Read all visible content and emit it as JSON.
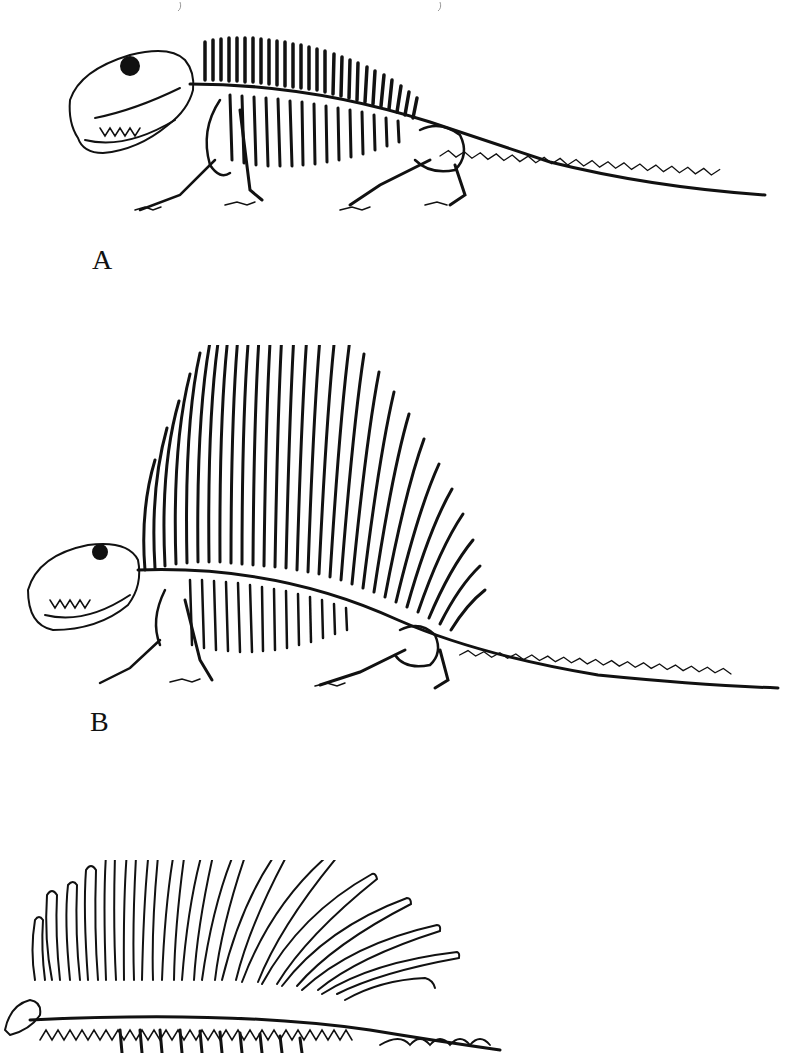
{
  "page": {
    "background": "#ffffff",
    "ink": "#111111"
  },
  "figures": [
    {
      "label": "A",
      "description": "skeleton-low-neural-spines",
      "label_pos": {
        "x": 94,
        "y": 246
      }
    },
    {
      "label": "B",
      "description": "skeleton-tall-sail",
      "label_pos": {
        "x": 90,
        "y": 708
      }
    },
    {
      "label": "",
      "description": "skeleton-sail-with-tubercles-partial",
      "label_pos": null
    }
  ]
}
